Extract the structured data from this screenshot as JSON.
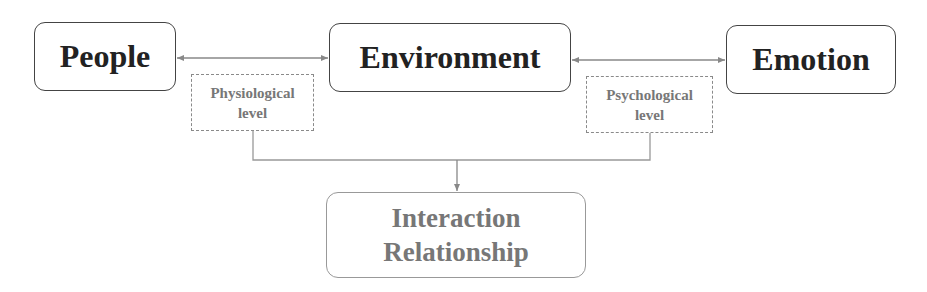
{
  "diagram": {
    "nodes": {
      "people": {
        "label": "People"
      },
      "environment": {
        "label": "Environment"
      },
      "emotion": {
        "label": "Emotion"
      },
      "physiological": {
        "line1": "Physiological",
        "line2": "level"
      },
      "psychological": {
        "line1": "Psychological",
        "line2": "level"
      },
      "interaction": {
        "line1": "Interaction",
        "line2": "Relationship"
      }
    },
    "edges": [
      {
        "from": "people",
        "to": "environment",
        "type": "bidirectional-arrow",
        "annotation": "physiological"
      },
      {
        "from": "environment",
        "to": "emotion",
        "type": "bidirectional-arrow",
        "annotation": "psychological"
      },
      {
        "from": "physiological",
        "to": "interaction",
        "type": "merge-arrow"
      },
      {
        "from": "psychological",
        "to": "interaction",
        "type": "merge-arrow"
      }
    ],
    "colors": {
      "primary_border": "#444444",
      "primary_text": "#222222",
      "secondary_border": "#8a8a8a",
      "secondary_text": "#777777",
      "connector": "#888888"
    }
  }
}
